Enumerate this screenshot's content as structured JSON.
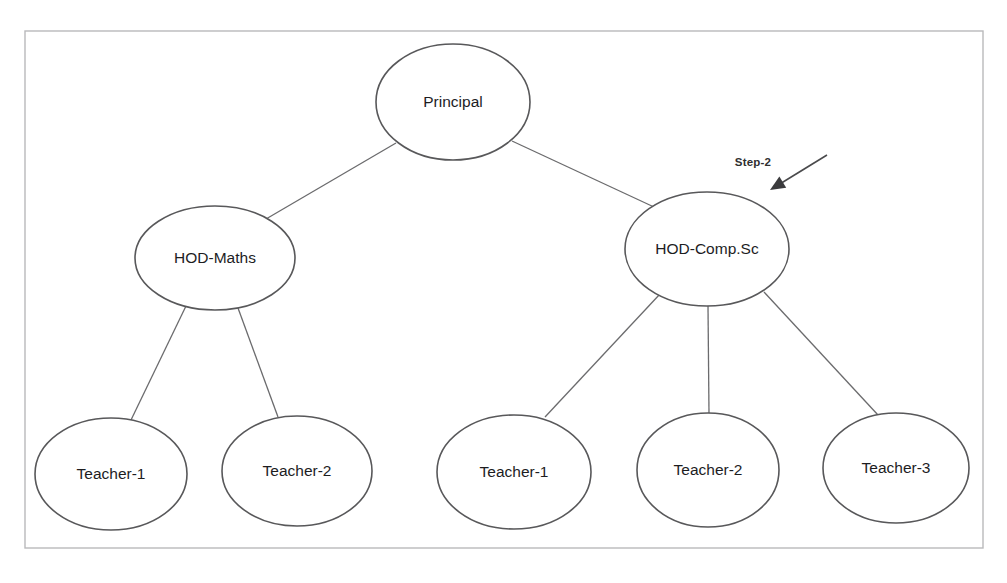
{
  "diagram": {
    "background_color": "#ffffff",
    "frame": {
      "x": 25,
      "y": 31,
      "width": 958,
      "height": 517,
      "stroke_color": "#b9b9bb"
    },
    "node_stroke_color": "#58585a",
    "node_fill_color": "#ffffff",
    "edge_color": "#6b6b6d",
    "label_color": "#1d1d1f",
    "annotation_color": "#2f2f31",
    "nodes": [
      {
        "id": "principal",
        "label": "Principal",
        "cx": 453,
        "cy": 102,
        "rx": 77,
        "ry": 58,
        "level": "root"
      },
      {
        "id": "hod-maths",
        "label": "HOD-Maths",
        "cx": 215,
        "cy": 258,
        "rx": 80,
        "ry": 52,
        "level": "department"
      },
      {
        "id": "hod-comp-sc",
        "label": "HOD-Comp.Sc",
        "cx": 707,
        "cy": 249,
        "rx": 82,
        "ry": 57,
        "level": "department"
      },
      {
        "id": "maths-teacher-1",
        "label": "Teacher-1",
        "cx": 111,
        "cy": 474,
        "rx": 76,
        "ry": 56,
        "level": "staff"
      },
      {
        "id": "maths-teacher-2",
        "label": "Teacher-2",
        "cx": 297,
        "cy": 471,
        "rx": 75,
        "ry": 55,
        "level": "staff"
      },
      {
        "id": "comp-teacher-1",
        "label": "Teacher-1",
        "cx": 514,
        "cy": 472,
        "rx": 77,
        "ry": 57,
        "level": "staff"
      },
      {
        "id": "comp-teacher-2",
        "label": "Teacher-2",
        "cx": 708,
        "cy": 470,
        "rx": 71,
        "ry": 57,
        "level": "staff"
      },
      {
        "id": "comp-teacher-3",
        "label": "Teacher-3",
        "cx": 896,
        "cy": 468,
        "rx": 73,
        "ry": 55,
        "level": "staff"
      }
    ],
    "edges": [
      {
        "id": "edge-principal-hod-maths",
        "from": "principal",
        "to": "hod-maths",
        "x1": 396,
        "y1": 143,
        "x2": 266,
        "y2": 219
      },
      {
        "id": "edge-principal-hod-comp",
        "from": "principal",
        "to": "hod-comp-sc",
        "x1": 512,
        "y1": 141,
        "x2": 654,
        "y2": 207
      },
      {
        "id": "edge-hod-maths-teacher-1",
        "from": "hod-maths",
        "to": "maths-teacher-1",
        "x1": 186,
        "y1": 306,
        "x2": 131,
        "y2": 420
      },
      {
        "id": "edge-hod-maths-teacher-2",
        "from": "hod-maths",
        "to": "maths-teacher-2",
        "x1": 238,
        "y1": 308,
        "x2": 278,
        "y2": 417
      },
      {
        "id": "edge-hod-comp-teacher-1",
        "from": "hod-comp-sc",
        "to": "comp-teacher-1",
        "x1": 660,
        "y1": 294,
        "x2": 545,
        "y2": 417
      },
      {
        "id": "edge-hod-comp-teacher-2",
        "from": "hod-comp-sc",
        "to": "comp-teacher-2",
        "x1": 708,
        "y1": 306,
        "x2": 709,
        "y2": 414
      },
      {
        "id": "edge-hod-comp-teacher-3",
        "from": "hod-comp-sc",
        "to": "comp-teacher-3",
        "x1": 764,
        "y1": 292,
        "x2": 878,
        "y2": 415
      }
    ],
    "annotation": {
      "id": "step-2-annotation",
      "label": "Step-2",
      "label_x": 753,
      "label_y": 163,
      "points_to": "hod-comp-sc",
      "arrow": {
        "x1": 827,
        "y1": 155,
        "x2": 770,
        "y2": 190
      }
    }
  }
}
